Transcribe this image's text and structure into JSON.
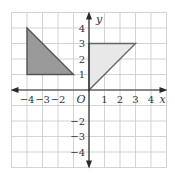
{
  "colors": {
    "grid": "#c8c8c8",
    "axis": "#2a2a2a",
    "shape_dark_fill": "#9a9a9a",
    "shape_dark_stroke": "#555555",
    "shape_light_fill": "#e8e8e8",
    "shape_light_stroke": "#666666"
  },
  "axes": {
    "x_label": "x",
    "y_label": "y",
    "origin_label": "O",
    "x_ticks": [
      {
        "value": -4,
        "label": "−4"
      },
      {
        "value": -3,
        "label": "−3"
      },
      {
        "value": -2,
        "label": "−2"
      },
      {
        "value": 1,
        "label": "1"
      },
      {
        "value": 2,
        "label": "2"
      },
      {
        "value": 3,
        "label": "3"
      },
      {
        "value": 4,
        "label": "4"
      }
    ],
    "y_ticks": [
      {
        "value": 4,
        "label": "4"
      },
      {
        "value": 3,
        "label": "3"
      },
      {
        "value": 2,
        "label": "2"
      },
      {
        "value": 1,
        "label": "1"
      },
      {
        "value": -2,
        "label": "−2"
      },
      {
        "value": -3,
        "label": "−3"
      },
      {
        "value": -4,
        "label": "−4"
      }
    ],
    "xlim": [
      -5,
      5
    ],
    "ylim": [
      -5,
      5
    ]
  },
  "shapes": [
    {
      "name": "dark-triangle",
      "vertices": [
        [
          -4,
          4
        ],
        [
          -4,
          1
        ],
        [
          -1,
          1
        ]
      ],
      "fill": "dark"
    },
    {
      "name": "light-triangle",
      "vertices": [
        [
          0,
          0
        ],
        [
          0,
          3
        ],
        [
          3,
          3
        ]
      ],
      "fill": "light"
    }
  ]
}
